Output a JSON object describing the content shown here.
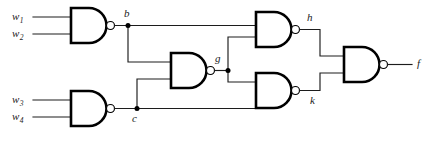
{
  "figure": {
    "background_color": "#ffffff",
    "wire_color": "#1c1c1c",
    "gate_outline_color": "#000000",
    "width": 444,
    "height": 154
  },
  "inputs": [
    {
      "id": "w1",
      "base": "w",
      "sub": "1"
    },
    {
      "id": "w2",
      "base": "w",
      "sub": "2"
    },
    {
      "id": "w3",
      "base": "w",
      "sub": "3"
    },
    {
      "id": "w4",
      "base": "w",
      "sub": "4"
    }
  ],
  "nodes": {
    "b": "b",
    "c": "c",
    "g": "g",
    "h": "h",
    "k": "k",
    "f": "f"
  },
  "gates": [
    {
      "id": "gate-b",
      "type": "NAND",
      "inputs": [
        "w1",
        "w2"
      ],
      "output": "b"
    },
    {
      "id": "gate-c",
      "type": "NAND",
      "inputs": [
        "w3",
        "w4"
      ],
      "output": "c"
    },
    {
      "id": "gate-g",
      "type": "NAND",
      "inputs": [
        "b",
        "c"
      ],
      "output": "g"
    },
    {
      "id": "gate-h",
      "type": "NAND",
      "inputs": [
        "b",
        "g"
      ],
      "output": "h"
    },
    {
      "id": "gate-k",
      "type": "NAND",
      "inputs": [
        "g",
        "c"
      ],
      "output": "k"
    },
    {
      "id": "gate-f",
      "type": "NAND",
      "inputs": [
        "h",
        "k"
      ],
      "output": "f"
    }
  ]
}
